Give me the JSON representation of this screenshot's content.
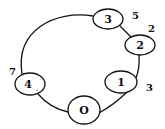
{
  "diagram": {
    "type": "ring-graph",
    "stroke_color": "#111111",
    "background": "#ffffff",
    "nodes": [
      {
        "id": "O",
        "label": "O",
        "cx": 84,
        "cy": 110,
        "rx": 16,
        "ry": 14
      },
      {
        "id": "1",
        "label": "1",
        "cx": 121,
        "cy": 82,
        "rx": 16,
        "ry": 11
      },
      {
        "id": "2",
        "label": "2",
        "cx": 140,
        "cy": 45,
        "rx": 15,
        "ry": 10
      },
      {
        "id": "3",
        "label": "3",
        "cx": 108,
        "cy": 19,
        "rx": 15,
        "ry": 10
      },
      {
        "id": "4",
        "label": "4",
        "cx": 30,
        "cy": 84,
        "rx": 15,
        "ry": 11
      }
    ],
    "edge_labels": [
      {
        "text": "5",
        "x": 132,
        "y": 19
      },
      {
        "text": "2",
        "x": 148,
        "y": 32
      },
      {
        "text": "3",
        "x": 146,
        "y": 91
      },
      {
        "text": "7",
        "x": 9,
        "y": 75
      }
    ]
  }
}
